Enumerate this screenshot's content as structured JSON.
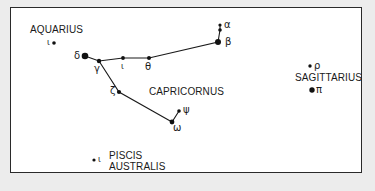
{
  "constellations": {
    "aquarius": "AQUARIUS",
    "capricornus": "CAPRICORNUS",
    "sagittarius": "SAGITTARIUS",
    "piscis_line1": "PISCIS",
    "piscis_line2": "AUSTRALIS"
  },
  "stars": {
    "aqr_iota": "ι",
    "cap_delta": "δ",
    "cap_gamma": "γ",
    "cap_iota": "ι",
    "cap_theta": "θ",
    "cap_beta": "β",
    "cap_alpha": "α",
    "cap_zeta": "ζ",
    "cap_psi": "ψ",
    "cap_omega": "ω",
    "sgr_rho": "ρ",
    "sgr_pi": "π",
    "psa_iota": "ι"
  },
  "colors": {
    "background": "#ececec",
    "panel": "#ffffff",
    "ink": "#1a1a1a"
  }
}
